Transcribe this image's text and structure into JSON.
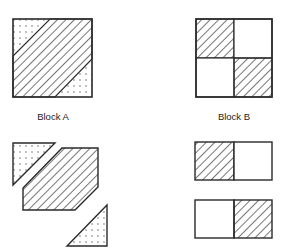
{
  "figure": {
    "type": "quilt-block-assembly-diagram",
    "colors": {
      "stroke": "#2a2a2a",
      "background": "#ffffff",
      "dots": "#555555"
    },
    "blocks": [
      {
        "id": "A",
        "label": "Block A",
        "assembled": {
          "description": "Square with diagonal hatched band (hexagon) from lower-left to upper-right, dotted triangles in top-left and bottom-right corners"
        },
        "exploded": {
          "pieces": [
            {
              "shape": "triangle",
              "fill": "dotted",
              "position": "top-left"
            },
            {
              "shape": "hexagon",
              "fill": "hatched",
              "position": "center"
            },
            {
              "shape": "triangle",
              "fill": "dotted",
              "position": "bottom-right"
            }
          ]
        }
      },
      {
        "id": "B",
        "label": "Block B",
        "assembled": {
          "description": "Four-patch square; top-left and bottom-right hatched, top-right and bottom-left plain"
        },
        "exploded": {
          "pieces": [
            {
              "shape": "rectangle-strip",
              "cells": [
                "hatched",
                "plain"
              ],
              "position": "top"
            },
            {
              "shape": "rectangle-strip",
              "cells": [
                "plain",
                "hatched"
              ],
              "position": "bottom"
            }
          ]
        }
      }
    ]
  }
}
